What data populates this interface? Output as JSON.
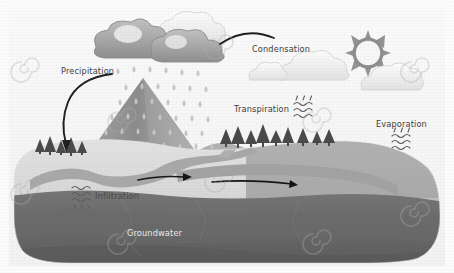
{
  "image": {
    "title": "Water Cycle Diagram",
    "width": 454,
    "height": 273,
    "background_color": "#fbfbfb",
    "border_color": "#f4f4f4"
  },
  "labels": {
    "precipitation": "Precipitation",
    "condensation": "Condensation",
    "transpiration": "Transpiration",
    "evaporation": "Evaporation",
    "infiltration": "Infiltration",
    "groundwater": "Groundwater"
  },
  "colors": {
    "sky": "#f7f7f7",
    "rain_cloud_dark": "#9a9a9a",
    "rain_cloud_mid": "#b4b4b4",
    "white_cloud": "#f2f2f2",
    "white_cloud_edge": "#d8d8d8",
    "sun_core": "#fafafa",
    "sun_corona": "#8f8f8f",
    "mountain_dark": "#8e8e8e",
    "mountain_light": "#b9b9b9",
    "raindrop": "#c9c9c9",
    "land_surface": "#d6d6d6",
    "land_mid": "#a9a9a9",
    "groundwater_dark": "#6f6f6f",
    "groundwater_deep": "#5e5e5e",
    "river": "#a6a6a6",
    "tree": "#4e4e4e",
    "arrow": "#262626",
    "label_dark": "#3d3d3d",
    "label_light": "#e8e8e8",
    "watermark": "rgba(170,170,170,0.30)"
  },
  "elements": {
    "sun": {
      "name": "sun",
      "cx": 368,
      "cy": 53,
      "radius": 17,
      "ray_count": 12
    },
    "rain_cloud": {
      "name": "rain-cloud",
      "cx": 148,
      "cy": 50
    },
    "white_clouds": [
      {
        "name": "cloud-left-small",
        "cx": 268,
        "cy": 72
      },
      {
        "name": "cloud-center",
        "cx": 313,
        "cy": 62
      },
      {
        "name": "cloud-right",
        "cx": 392,
        "cy": 78
      },
      {
        "name": "cloud-top-highlight",
        "cx": 178,
        "cy": 33
      }
    ],
    "mountain": {
      "name": "mountain",
      "peak_x": 143,
      "peak_y": 78,
      "base_y": 152
    },
    "raindrop_grid": {
      "name": "raindrop-field",
      "rows": 6,
      "columns": 8,
      "count": 44
    },
    "transpiration_waves": {
      "name": "transpiration-waves",
      "x": 299,
      "y": 98,
      "wave_count": 3
    },
    "evaporation_waves": {
      "name": "evaporation-waves",
      "x": 397,
      "y": 130,
      "wave_count": 3
    },
    "infiltration_waves": {
      "name": "infiltration-waves",
      "x": 77,
      "y": 190,
      "wave_count": 3
    },
    "tree_line_left": {
      "name": "tree-line-left",
      "count": 5,
      "x_start": 38,
      "y": 150
    },
    "tree_line_right": {
      "name": "tree-line-right",
      "count": 9,
      "x_start": 222,
      "y": 140
    },
    "arrows": [
      {
        "name": "precipitation-arrow",
        "from": "label",
        "to": "mountain-base"
      },
      {
        "name": "condensation-arrow",
        "from": "cloud",
        "to": "label"
      },
      {
        "name": "river-flow-arrow-left",
        "direction": "right"
      },
      {
        "name": "river-flow-arrow-right",
        "direction": "right"
      }
    ]
  },
  "watermarks": {
    "glyph": "spiral",
    "positions": [
      {
        "x": 28,
        "y": 68
      },
      {
        "x": 125,
        "y": 118
      },
      {
        "x": 222,
        "y": 45
      },
      {
        "x": 222,
        "y": 178
      },
      {
        "x": 320,
        "y": 118
      },
      {
        "x": 418,
        "y": 68
      },
      {
        "x": 418,
        "y": 212
      },
      {
        "x": 125,
        "y": 240
      },
      {
        "x": 28,
        "y": 190
      },
      {
        "x": 320,
        "y": 240
      }
    ]
  }
}
